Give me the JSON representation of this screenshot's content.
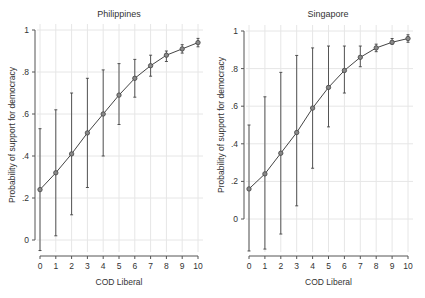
{
  "chart_data": [
    {
      "type": "line",
      "title": "Philippines",
      "xlabel": "COD Liberal",
      "ylabel": "Probability of support for democracy",
      "x": [
        0,
        1,
        2,
        3,
        4,
        5,
        6,
        7,
        8,
        9,
        10
      ],
      "xticks": [
        "0",
        "1",
        "2",
        "3",
        "4",
        "5",
        "6",
        "7",
        "8",
        "9",
        "10"
      ],
      "yticks": [
        0,
        0.2,
        0.4,
        0.6,
        0.8,
        1
      ],
      "ytick_labels": [
        "0",
        ".2",
        ".4",
        ".6",
        ".8",
        "1"
      ],
      "ylim": [
        -0.05,
        1
      ],
      "grid": true,
      "series": [
        {
          "name": "Predicted probability",
          "values": [
            0.24,
            0.32,
            0.41,
            0.51,
            0.6,
            0.69,
            0.77,
            0.83,
            0.88,
            0.91,
            0.94
          ],
          "ci_low": [
            -0.05,
            0.02,
            0.12,
            0.25,
            0.4,
            0.55,
            0.68,
            0.78,
            0.85,
            0.89,
            0.92
          ],
          "ci_high": [
            0.53,
            0.62,
            0.7,
            0.77,
            0.81,
            0.84,
            0.86,
            0.88,
            0.9,
            0.93,
            0.96
          ]
        }
      ]
    },
    {
      "type": "line",
      "title": "Singapore",
      "xlabel": "COD Liberal",
      "ylabel": "Probability of support for democracy",
      "x": [
        0,
        1,
        2,
        3,
        4,
        5,
        6,
        7,
        8,
        9,
        10
      ],
      "xticks": [
        "0",
        "1",
        "2",
        "3",
        "4",
        "5",
        "6",
        "7",
        "8",
        "9",
        "10"
      ],
      "yticks": [
        0,
        0.2,
        0.4,
        0.6,
        0.8,
        1
      ],
      "ytick_labels": [
        "0",
        ".2",
        ".4",
        ".6",
        ".8",
        "1"
      ],
      "ylim": [
        -0.18,
        1
      ],
      "grid": true,
      "series": [
        {
          "name": "Predicted probability",
          "values": [
            0.16,
            0.24,
            0.35,
            0.46,
            0.59,
            0.7,
            0.79,
            0.86,
            0.91,
            0.94,
            0.96
          ],
          "ci_low": [
            -0.17,
            -0.16,
            -0.08,
            0.07,
            0.27,
            0.49,
            0.67,
            0.81,
            0.89,
            0.93,
            0.94
          ],
          "ci_high": [
            0.5,
            0.65,
            0.78,
            0.87,
            0.91,
            0.92,
            0.92,
            0.92,
            0.93,
            0.96,
            0.98
          ]
        }
      ]
    }
  ],
  "colors": {
    "line": "#444444",
    "grid": "#e6e6e6",
    "axis": "#555555"
  }
}
